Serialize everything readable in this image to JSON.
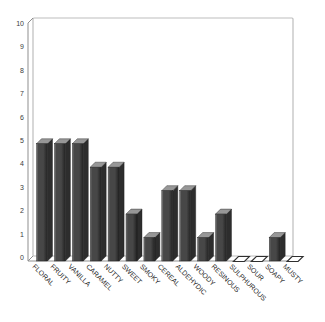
{
  "chart_data": {
    "type": "bar",
    "style": "3d-column",
    "title": "",
    "xlabel": "",
    "ylabel": "",
    "grid": false,
    "legend": "none",
    "ylim": [
      0,
      10
    ],
    "yticks": [
      "0",
      "1",
      "2",
      "3",
      "4",
      "5",
      "6",
      "7",
      "8",
      "9",
      "10"
    ],
    "categories": [
      "FLORAL",
      "FRUITY",
      "VANILLA",
      "CARAMEL",
      "NUTTY",
      "SWEET",
      "SMOKY",
      "CEREAL",
      "ALDEHYDIC",
      "WOODY",
      "RESINOUS",
      "SULPHUROUS",
      "SOUR",
      "SOAPY",
      "MUSTY"
    ],
    "values": [
      5,
      5,
      5,
      4,
      4,
      2,
      1,
      3,
      3,
      1,
      2,
      0,
      0,
      1,
      0
    ],
    "colors": {
      "background": "#ffffff",
      "bar_front": "#474747",
      "bar_front_highlight": "#7d7d7d",
      "bar_front_shadow": "#222222",
      "bar_top": "#979797",
      "bar_side": "#2d2d2d",
      "bar_outline": "#1c1c1c",
      "zero_marker_fill": "#ffffff",
      "zero_marker_border": "#2f2f2f",
      "wall_fill": "#ffffff",
      "wall_border": "#bdbdbd",
      "axis_line": "#8f8f8f",
      "tick_text": "#3a3a3a",
      "label_text": "#1f1f1f"
    }
  }
}
